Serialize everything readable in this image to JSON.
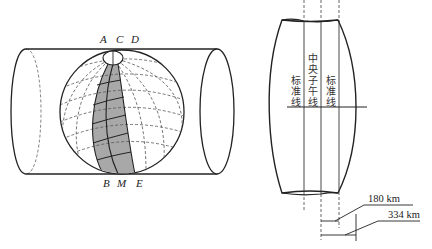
{
  "figure": {
    "left_diagram": {
      "title": "Transverse cylindrical projection (Gauss-Krüger)",
      "top_labels": [
        "A",
        "C",
        "D"
      ],
      "bottom_labels": [
        "B",
        "M",
        "E"
      ]
    },
    "right_diagram": {
      "standard_line_left": "标准线",
      "central_meridian": "中央子午线",
      "standard_line_right": "标准线",
      "dim_inner": "180 km",
      "dim_outer": "334 km"
    },
    "colors": {
      "stroke": "#222222",
      "dashed": "#555555",
      "shaded_zone": "#a8a8a8"
    }
  }
}
